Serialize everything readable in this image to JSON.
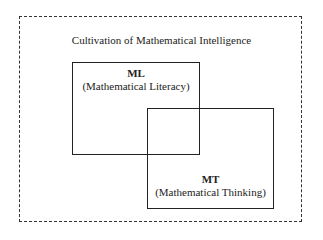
{
  "diagram": {
    "title": "Cultivation of Mathematical Intelligence",
    "boxes": [
      {
        "abbr": "ML",
        "full": "(Mathematical Literacy)"
      },
      {
        "abbr": "MT",
        "full": "(Mathematical Thinking)"
      }
    ]
  }
}
